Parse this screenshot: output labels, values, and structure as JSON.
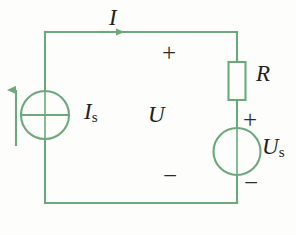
{
  "figure": {
    "kind": "circuit-diagram",
    "title": "",
    "wire_color": "#6da87d",
    "label_color": "#231f20",
    "background": "#fdfdfb",
    "width": 296,
    "height": 235
  },
  "labels": {
    "current_I": "I",
    "current_source": {
      "symbol": "I",
      "subscript": "s"
    },
    "voltage_U": "U",
    "resistor": "R",
    "voltage_source": {
      "symbol": "U",
      "subscript": "s"
    }
  },
  "polarity": {
    "u_plus": "+",
    "u_minus": "−",
    "us_plus": "+",
    "us_minus": "−"
  },
  "components": [
    {
      "name": "current-source",
      "type": "ideal-current-source",
      "label": "Is",
      "orientation": "vertical",
      "position": "left-branch"
    },
    {
      "name": "resistor",
      "type": "resistor",
      "label": "R",
      "orientation": "vertical",
      "position": "right-branch-upper"
    },
    {
      "name": "voltage-source",
      "type": "ideal-voltage-source",
      "label": "Us",
      "orientation": "vertical",
      "position": "right-branch-lower"
    }
  ],
  "arrows": [
    {
      "name": "current-arrow-I",
      "direction": "right",
      "on": "top-wire",
      "label": "I"
    },
    {
      "name": "current-source-direction-arrow",
      "direction": "up",
      "on": "left-of-current-source",
      "label": ""
    }
  ]
}
